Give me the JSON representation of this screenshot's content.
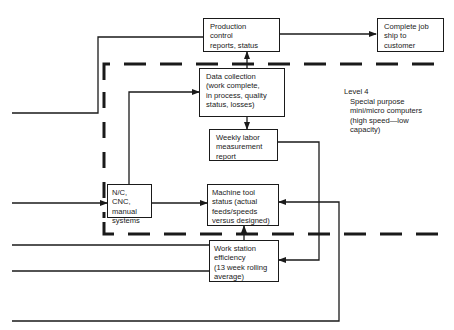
{
  "diagram": {
    "boxes": {
      "production_control": {
        "label": "Production\ncontrol\nreports, status"
      },
      "complete_job": {
        "label": "Complete job\nship to\ncustomer"
      },
      "data_collection": {
        "label": "Data collection\n(work complete,\nin process, quality\nstatus, losses)"
      },
      "weekly_labor": {
        "label": "Weekly labor\nmeasurement\nreport"
      },
      "nc_cnc": {
        "label": "N/C, CNC,\nmanual\nsystems"
      },
      "machine_tool": {
        "label": "Machine tool\nstatus (actual\nfeeds/speeds\nversus designed)"
      },
      "work_station": {
        "label": "Work station\nefficiency\n(13 week rolling\naverage)"
      }
    },
    "level_note": {
      "title": "Level 4",
      "description": "Special purpose\nmini/micro computers\n(high speed—low\ncapacity)"
    },
    "colors": {
      "line": "#1a1a1a",
      "background": "#ffffff"
    }
  }
}
